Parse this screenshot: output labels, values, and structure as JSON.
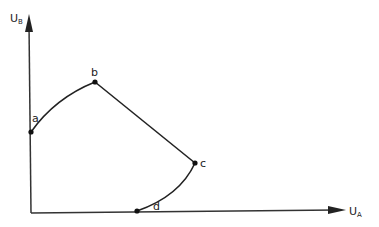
{
  "diagram": {
    "axes": {
      "x_label": "U",
      "x_label_sub": "A",
      "y_label": "U",
      "y_label_sub": "B"
    },
    "points": [
      {
        "name": "a",
        "x": 31,
        "y": 132
      },
      {
        "name": "b",
        "x": 95,
        "y": 82
      },
      {
        "name": "c",
        "x": 195,
        "y": 163
      },
      {
        "name": "d",
        "x": 137,
        "y": 211
      }
    ],
    "segments": [
      {
        "from": "a",
        "to": "b",
        "shape": "curve"
      },
      {
        "from": "b",
        "to": "c",
        "shape": "line"
      },
      {
        "from": "c",
        "to": "d",
        "shape": "curve"
      }
    ],
    "colors": {
      "stroke": "#222222",
      "background": "#ffffff"
    }
  }
}
